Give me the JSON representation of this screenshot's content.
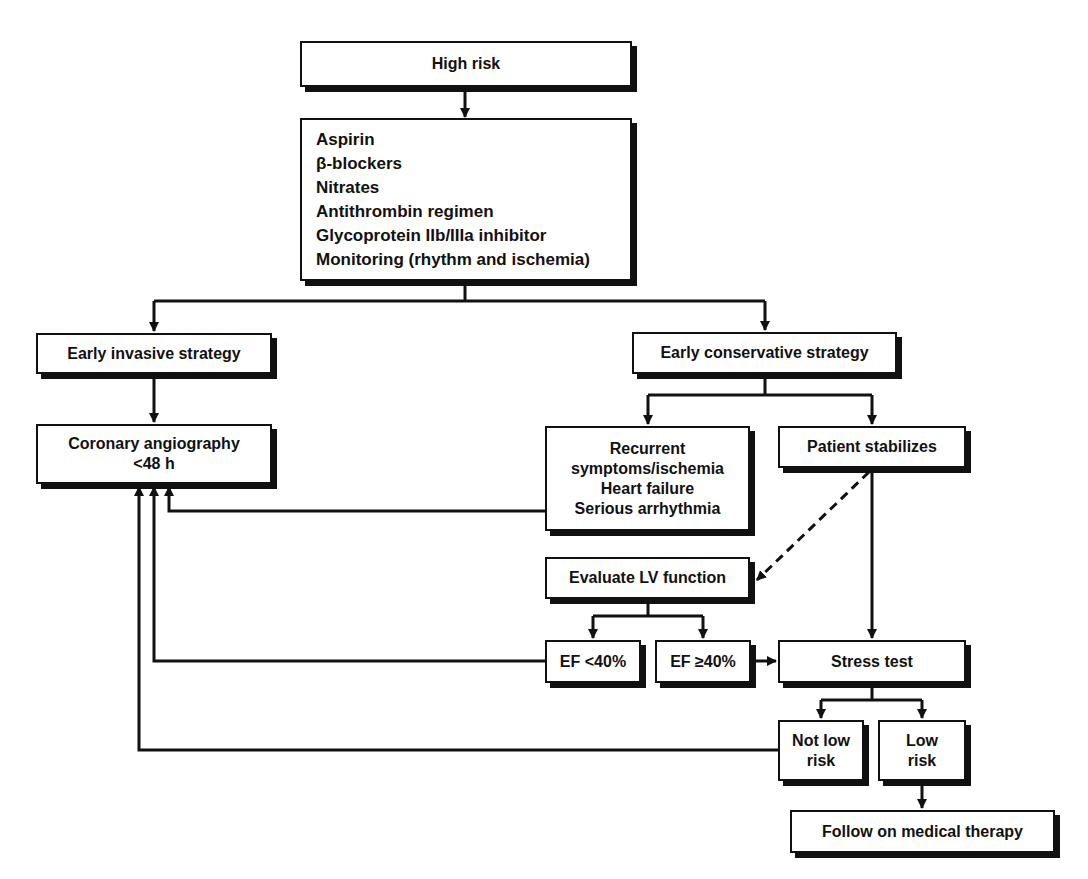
{
  "diagram": {
    "colors": {
      "line": "#111111",
      "box_fill": "#ffffff",
      "background": "#ffffff"
    },
    "nodes": {
      "high_risk": {
        "label": "High risk"
      },
      "medications": {
        "lines": [
          "Aspirin",
          "β-blockers",
          "Nitrates",
          "Antithrombin regimen",
          "Glycoprotein IIb/IIIa inhibitor",
          "Monitoring (rhythm and ischemia)"
        ]
      },
      "early_invasive": {
        "label": "Early invasive strategy"
      },
      "early_conservative": {
        "label": "Early conservative strategy"
      },
      "coronary_angiography": {
        "lines": [
          "Coronary angiography",
          "<48 h"
        ]
      },
      "recurrent": {
        "lines": [
          "Recurrent",
          "symptoms/ischemia",
          "Heart failure",
          "Serious arrhythmia"
        ]
      },
      "patient_stabilizes": {
        "label": "Patient stabilizes"
      },
      "evaluate_lv": {
        "label": "Evaluate LV function"
      },
      "ef_low": {
        "label": "EF <40%"
      },
      "ef_high": {
        "label": "EF ≥40%"
      },
      "stress_test": {
        "label": "Stress test"
      },
      "not_low_risk": {
        "lines": [
          "Not low",
          "risk"
        ]
      },
      "low_risk": {
        "lines": [
          "Low",
          "risk"
        ]
      },
      "follow_medical": {
        "label": "Follow on medical therapy"
      }
    },
    "edges": [
      {
        "from": "high_risk",
        "to": "medications",
        "style": "solid"
      },
      {
        "from": "medications",
        "to": "early_invasive",
        "style": "solid"
      },
      {
        "from": "medications",
        "to": "early_conservative",
        "style": "solid"
      },
      {
        "from": "early_invasive",
        "to": "coronary_angiography",
        "style": "solid"
      },
      {
        "from": "early_conservative",
        "to": "recurrent",
        "style": "solid"
      },
      {
        "from": "early_conservative",
        "to": "patient_stabilizes",
        "style": "solid"
      },
      {
        "from": "recurrent",
        "to": "coronary_angiography",
        "style": "solid"
      },
      {
        "from": "patient_stabilizes",
        "to": "evaluate_lv",
        "style": "dashed"
      },
      {
        "from": "patient_stabilizes",
        "to": "stress_test",
        "style": "solid"
      },
      {
        "from": "evaluate_lv",
        "to": "ef_low",
        "style": "solid"
      },
      {
        "from": "evaluate_lv",
        "to": "ef_high",
        "style": "solid"
      },
      {
        "from": "ef_low",
        "to": "coronary_angiography",
        "style": "solid"
      },
      {
        "from": "ef_high",
        "to": "stress_test",
        "style": "solid"
      },
      {
        "from": "stress_test",
        "to": "not_low_risk",
        "style": "solid"
      },
      {
        "from": "stress_test",
        "to": "low_risk",
        "style": "solid"
      },
      {
        "from": "not_low_risk",
        "to": "coronary_angiography",
        "style": "solid"
      },
      {
        "from": "low_risk",
        "to": "follow_medical",
        "style": "solid"
      }
    ]
  }
}
